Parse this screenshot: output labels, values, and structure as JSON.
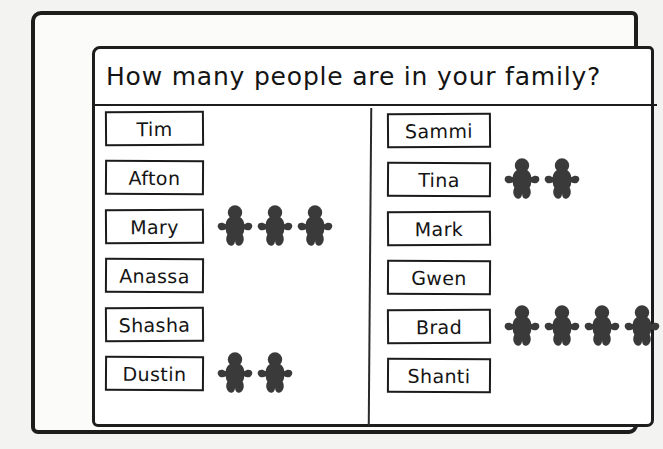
{
  "title": "How many people are in your family?",
  "figure_color": "#3a3a3a",
  "ink_color": "#1b1b1b",
  "paper_color": "#ffffff",
  "chart_data": {
    "type": "bar",
    "title": "How many people are in your family?",
    "xlabel": "",
    "ylabel": "",
    "unit_icon": "person-figure-icon",
    "orientation": "horizontal",
    "note": "Each dark gingerbread-person silhouette represents one tally unit placed beside the respondent's name box.",
    "categories": [
      "Tim",
      "Afton",
      "Mary",
      "Anassa",
      "Shasha",
      "Dustin",
      "Sammi",
      "Tina",
      "Mark",
      "Gwen",
      "Brad",
      "Shanti"
    ],
    "values": [
      0,
      0,
      3,
      0,
      0,
      2,
      0,
      2,
      0,
      0,
      4,
      0
    ],
    "xlim": [
      0,
      4
    ],
    "grid": false,
    "legend": false
  },
  "columns": [
    {
      "id": "left",
      "rows": [
        {
          "name": "Tim",
          "count": 0
        },
        {
          "name": "Afton",
          "count": 0
        },
        {
          "name": "Mary",
          "count": 3
        },
        {
          "name": "Anassa",
          "count": 0
        },
        {
          "name": "Shasha",
          "count": 0
        },
        {
          "name": "Dustin",
          "count": 2
        }
      ]
    },
    {
      "id": "right",
      "rows": [
        {
          "name": "Sammi",
          "count": 0
        },
        {
          "name": "Tina",
          "count": 2
        },
        {
          "name": "Mark",
          "count": 0
        },
        {
          "name": "Gwen",
          "count": 0
        },
        {
          "name": "Brad",
          "count": 4
        },
        {
          "name": "Shanti",
          "count": 0
        }
      ]
    }
  ]
}
